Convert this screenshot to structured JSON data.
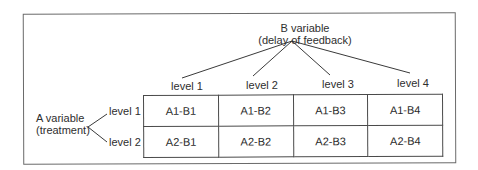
{
  "diagram": {
    "b_variable": {
      "title": "B variable",
      "subtitle": "(delay of feedback)",
      "levels": [
        "level 1",
        "level 2",
        "level 3",
        "level 4"
      ]
    },
    "a_variable": {
      "title": "A variable",
      "subtitle": "(treatment)",
      "levels": [
        "level 1",
        "level 2"
      ]
    },
    "cells": [
      [
        "A1-B1",
        "A1-B2",
        "A1-B3",
        "A1-B4"
      ],
      [
        "A2-B1",
        "A2-B2",
        "A2-B3",
        "A2-B4"
      ]
    ],
    "colors": {
      "line": "#3a3a3a",
      "frame": "#6a6a6a",
      "text": "#2a2a2a",
      "background": "#ffffff"
    }
  }
}
